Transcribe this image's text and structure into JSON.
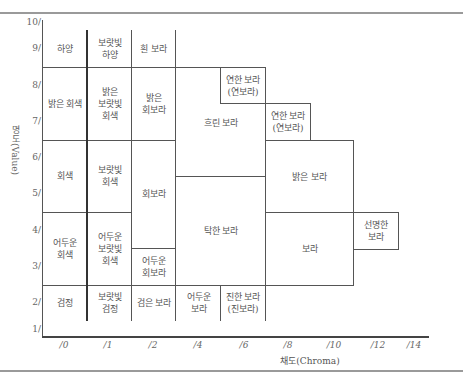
{
  "axes": {
    "y_label": "명도(Value)",
    "x_label": "채도(Chroma)",
    "y_ticks": [
      "10/",
      "9/",
      "8/",
      "7/",
      "6/",
      "5/",
      "4/",
      "3/",
      "2/",
      "1/"
    ],
    "x_ticks": [
      "/0",
      "/1",
      "/2",
      "/4",
      "/6",
      "/8",
      "/10",
      "/12",
      "/14"
    ]
  },
  "cells": {
    "white": "하양",
    "purplish_white": "보랏빛\n하양",
    "whitish_purple": "흰 보라",
    "light_gray": "밝은 회색",
    "light_purplish_gray": "밝은\n보랏빛\n회색",
    "light_grayish_purple": "밝은\n회보라",
    "pale_purple_1": "연한 보라\n(연보라)",
    "pale_purple_2": "연한 보라\n(연보라)",
    "soft_purple": "흐린 보라",
    "light_purple": "밝은 보라",
    "gray": "회색",
    "purplish_gray": "보랏빛\n회색",
    "grayish_purple": "회보라",
    "dull_purple": "탁한 보라",
    "purple": "보라",
    "vivid_purple": "선명한\n보라",
    "dark_gray": "어두운\n회색",
    "dark_purplish_gray": "어두운\n보랏빛\n회색",
    "dark_grayish_purple": "어두운\n회보라",
    "black": "검정",
    "purplish_black": "보랏빛\n검정",
    "blackish_purple": "검은 보라",
    "dark_purple": "어두운\n보라",
    "deep_purple": "진한 보라\n(진보라)"
  }
}
